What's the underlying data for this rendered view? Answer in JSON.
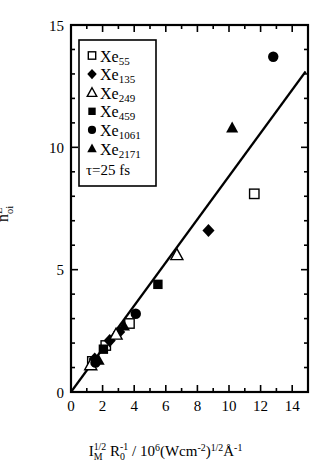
{
  "chart_data": {
    "type": "scatter",
    "title": "",
    "xlabel": "I_M^(1/2) R_0^(-1) / 10^6 (Wcm^-2)^(1/2) Angstrom^-1",
    "ylabel": "n_oi^L",
    "xlim": [
      0,
      15
    ],
    "ylim": [
      0,
      15
    ],
    "xticks": [
      0,
      2,
      4,
      6,
      8,
      10,
      12,
      14
    ],
    "yticks": [
      0,
      5,
      10,
      15
    ],
    "xtick_labels": [
      "0",
      "2",
      "4",
      "6",
      "8",
      "10",
      "12",
      "14"
    ],
    "ytick_labels": [
      "0",
      "5",
      "10",
      "15"
    ],
    "xminor_step": 1,
    "yminor_step": 1,
    "grid": false,
    "legend_position": "upper-left",
    "series": [
      {
        "name": "Xe55",
        "marker": "open-square",
        "points": [
          {
            "x": 1.35,
            "y": 1.25
          },
          {
            "x": 2.2,
            "y": 1.9
          },
          {
            "x": 3.7,
            "y": 2.8
          },
          {
            "x": 11.6,
            "y": 8.1
          }
        ]
      },
      {
        "name": "Xe135",
        "marker": "filled-diamond",
        "points": [
          {
            "x": 1.5,
            "y": 1.35
          },
          {
            "x": 2.45,
            "y": 2.1
          },
          {
            "x": 3.05,
            "y": 2.45
          },
          {
            "x": 8.7,
            "y": 6.6
          }
        ]
      },
      {
        "name": "Xe249",
        "marker": "open-triangle",
        "points": [
          {
            "x": 1.25,
            "y": 1.1
          },
          {
            "x": 2.85,
            "y": 2.35
          },
          {
            "x": 6.7,
            "y": 5.6
          }
        ]
      },
      {
        "name": "Xe459",
        "marker": "filled-square",
        "points": [
          {
            "x": 2.05,
            "y": 1.75
          },
          {
            "x": 5.5,
            "y": 4.4
          }
        ]
      },
      {
        "name": "Xe1061",
        "marker": "filled-circle",
        "points": [
          {
            "x": 1.55,
            "y": 1.2
          },
          {
            "x": 4.1,
            "y": 3.2
          },
          {
            "x": 12.8,
            "y": 13.7
          }
        ]
      },
      {
        "name": "Xe2171",
        "marker": "filled-triangle",
        "points": [
          {
            "x": 1.75,
            "y": 1.3
          },
          {
            "x": 3.35,
            "y": 2.7
          },
          {
            "x": 10.2,
            "y": 10.8
          }
        ]
      }
    ],
    "fit_line": {
      "name": "linear-fit",
      "x0": 0.0,
      "y0": 0.0,
      "x1": 14.85,
      "y1": 13.1
    },
    "annotations": [
      {
        "name": "pulse-duration",
        "text": "τ=25 fs"
      }
    ]
  },
  "legend": {
    "entries": [
      {
        "label_base": "Xe",
        "label_sub": "55",
        "marker": "open-square"
      },
      {
        "label_base": "Xe",
        "label_sub": "135",
        "marker": "filled-diamond"
      },
      {
        "label_base": "Xe",
        "label_sub": "249",
        "marker": "open-triangle"
      },
      {
        "label_base": "Xe",
        "label_sub": "459",
        "marker": "filled-square"
      },
      {
        "label_base": "Xe",
        "label_sub": "1061",
        "marker": "filled-circle"
      },
      {
        "label_base": "Xe",
        "label_sub": "2171",
        "marker": "filled-triangle"
      }
    ],
    "note": "τ=25 fs"
  },
  "axes": {
    "x_label_parts": {
      "i": "I",
      "i_sub": "M",
      "i_sup": "1/2",
      "r": "R",
      "r_sub": "0",
      "r_sup": "-1",
      "slash": "/",
      "ten": "10",
      "ten_sup": "6",
      "unit_open": "(Wcm",
      "unit_sup1": "-2",
      "unit_close": ")",
      "unit_sup2": "1/2",
      "angstrom": "Å",
      "angstrom_sup": "-1"
    },
    "y_label_parts": {
      "n": "n",
      "sup": "L",
      "sub": "oi"
    }
  },
  "style": {
    "axis_color": "#000000",
    "marker_color": "#000000",
    "line_color": "#000000",
    "background": "#ffffff"
  }
}
